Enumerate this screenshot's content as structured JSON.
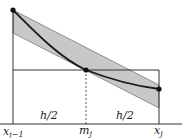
{
  "diagram": {
    "colors": {
      "band_fill": "#c8c8c8",
      "curve": "#1a1a1a",
      "lines": "#333333",
      "background": "#ffffff"
    },
    "labels": {
      "left_half": "h/2",
      "right_half": "h/2",
      "x_left_base": "x",
      "x_left_sub": "j−1",
      "mid_base": "m",
      "mid_sub": "j",
      "x_right_base": "x",
      "x_right_sub": "j"
    },
    "points": {
      "left_endpoint": [
        13,
        10
      ],
      "midpoint": [
        86,
        70
      ],
      "right_endpoint": [
        159,
        89
      ]
    }
  }
}
